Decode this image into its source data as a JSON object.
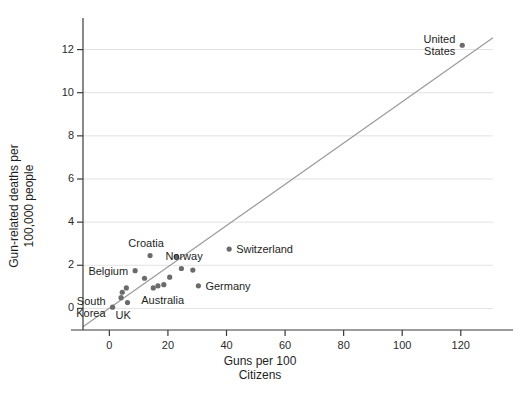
{
  "chart_data": {
    "type": "scatter",
    "title": "",
    "xlabel": "Guns per 100\nCitizens",
    "ylabel": "Gun-related deaths per\n100,000 people",
    "xlim": [
      -9,
      131
    ],
    "ylim": [
      -1.0,
      13.0
    ],
    "xticks": [
      0,
      20,
      40,
      60,
      80,
      100,
      120
    ],
    "yticks": [
      0,
      2,
      4,
      6,
      8,
      10,
      12
    ],
    "xtick_labels": [
      "0",
      "20",
      "40",
      "60",
      "80",
      "100",
      "120"
    ],
    "ytick_labels": [
      "0",
      "2",
      "4",
      "6",
      "8",
      "10",
      "12"
    ],
    "grid": "horizontal",
    "legend": "none",
    "point_color": "#6b6b6b",
    "line_color": "#9a9a9a",
    "axis_color": "#3a3a3a",
    "grid_color": "#e2e2e2",
    "trendline": {
      "x": [
        -9,
        131
      ],
      "y": [
        -0.85,
        12.55
      ]
    },
    "points": [
      {
        "label": "South Korea",
        "x": 1.1,
        "y": 0.06,
        "label_pos": "left",
        "label_text": "South\nKorea"
      },
      {
        "label": "unlabeled-1",
        "x": 4.0,
        "y": 0.5,
        "label_pos": "none",
        "label_text": ""
      },
      {
        "label": "unlabeled-2",
        "x": 4.4,
        "y": 0.75,
        "label_pos": "none",
        "label_text": ""
      },
      {
        "label": "UK",
        "x": 6.2,
        "y": 0.27,
        "label_pos": "below",
        "label_text": "UK"
      },
      {
        "label": "unlabeled-3",
        "x": 5.8,
        "y": 0.95,
        "label_pos": "none",
        "label_text": ""
      },
      {
        "label": "Belgium",
        "x": 8.8,
        "y": 1.75,
        "label_pos": "left",
        "label_text": "Belgium"
      },
      {
        "label": "unlabeled-4",
        "x": 12.0,
        "y": 1.4,
        "label_pos": "none",
        "label_text": ""
      },
      {
        "label": "Croatia-a",
        "x": 13.9,
        "y": 2.45,
        "label_pos": "none",
        "label_text": ""
      },
      {
        "label": "Australia",
        "x": 15.0,
        "y": 0.95,
        "label_pos": "below",
        "label_text": "Australia"
      },
      {
        "label": "unlabeled-5",
        "x": 16.6,
        "y": 1.05,
        "label_pos": "none",
        "label_text": ""
      },
      {
        "label": "unlabeled-6",
        "x": 18.6,
        "y": 1.1,
        "label_pos": "none",
        "label_text": ""
      },
      {
        "label": "unlabeled-7",
        "x": 20.6,
        "y": 1.45,
        "label_pos": "none",
        "label_text": ""
      },
      {
        "label": "Croatia-b",
        "x": 22.9,
        "y": 2.4,
        "label_pos": "none",
        "label_text": ""
      },
      {
        "label": "Norway",
        "x": 24.6,
        "y": 1.85,
        "label_pos": "above",
        "label_text": "Norway"
      },
      {
        "label": "unlabeled-8",
        "x": 28.5,
        "y": 1.78,
        "label_pos": "none",
        "label_text": ""
      },
      {
        "label": "Germany",
        "x": 30.4,
        "y": 1.05,
        "label_pos": "right",
        "label_text": "Germany"
      },
      {
        "label": "Switzerland",
        "x": 40.9,
        "y": 2.75,
        "label_pos": "right",
        "label_text": "Switzerland"
      },
      {
        "label": "United States",
        "x": 120.5,
        "y": 12.2,
        "label_pos": "left",
        "label_text": "United\nStates"
      }
    ],
    "annotations": [
      {
        "name": "croatia-label",
        "text": "Croatia",
        "x": 14.0,
        "y": 3.05
      }
    ]
  }
}
